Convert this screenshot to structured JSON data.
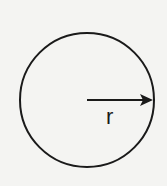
{
  "diagram": {
    "shapes": [
      {
        "type": "circle",
        "cx": 87,
        "cy": 100,
        "r": 67
      },
      {
        "type": "arrow",
        "from": [
          87,
          100
        ],
        "to": [
          153,
          100
        ]
      }
    ],
    "radius_label": "r",
    "colors": {
      "stroke": "#1a1a1a",
      "background": "#f4f4f2"
    }
  }
}
